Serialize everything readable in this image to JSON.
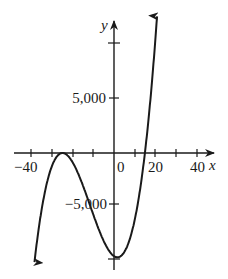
{
  "chart_data": {
    "type": "line",
    "title": "",
    "xlabel": "x",
    "ylabel": "y",
    "function_description": "cubic polynomial with double root near x = -25 and single root near x = 15",
    "x_ticks": [
      -40,
      -30,
      -20,
      -10,
      0,
      10,
      20,
      30,
      40
    ],
    "x_tick_labels": [
      "-40",
      "0",
      "20",
      "40"
    ],
    "x_tick_labels_display": [
      "−40",
      "0",
      "20",
      "40"
    ],
    "y_ticks": [
      -10000,
      -5000,
      5000,
      10000
    ],
    "y_tick_labels": [
      "5,000",
      "-5,000"
    ],
    "y_tick_labels_display": [
      "5,000",
      "−5,000"
    ],
    "xlim": [
      -44,
      44
    ],
    "ylim": [
      -11500,
      12000
    ],
    "grid": false,
    "series": [
      {
        "name": "f(x)",
        "x": [
          -39,
          -35,
          -30,
          -25,
          -20,
          -15,
          -10,
          -5,
          0,
          2,
          5,
          10,
          15,
          18,
          21
        ],
        "y": [
          -10584,
          -5000,
          -1125,
          0,
          -875,
          -3000,
          -5625,
          -8000,
          -9375,
          -9400,
          -9000,
          -6125,
          0,
          5000,
          11000
        ]
      }
    ],
    "features": {
      "local_max": {
        "x": -25,
        "y": 0
      },
      "local_min": {
        "x": 1.7,
        "y": -9400
      },
      "roots": [
        -25,
        15
      ],
      "arrows_on_ends": true
    }
  },
  "labels": {
    "x_axis": "x",
    "y_axis": "y",
    "xt_neg40": "−40",
    "xt_0": "0",
    "xt_20": "20",
    "xt_40": "40",
    "yt_5000": "5,000",
    "yt_neg5000": "−5,000"
  }
}
